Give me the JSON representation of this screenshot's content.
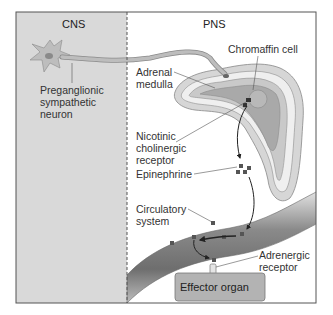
{
  "regions": {
    "cns_label": "CNS",
    "pns_label": "PNS"
  },
  "labels": {
    "preganglionic": "Preganglionic\nsympathetic\nneuron",
    "adrenal_medulla": "Adrenal\nmedulla",
    "chromaffin_cell": "Chromaffin cell",
    "nicotinic_receptor": "Nicotinic\ncholinergic\nreceptor",
    "epinephrine": "Epinephrine",
    "circulatory_system": "Circulatory\nsystem",
    "adrenergic_receptor": "Adrenergic\nreceptor",
    "effector_organ": "Effector organ"
  },
  "colors": {
    "cns_bg": "#d9d9d9",
    "pns_bg": "#ffffff",
    "frame": "#555555",
    "neuron": "#b5b5b5",
    "adrenal_outer": "#c8c8c8",
    "adrenal_inner": "#a8a8a8",
    "vessel": "#8c8c8c",
    "molecule": "#555555",
    "effector": "#b0b0b0"
  }
}
